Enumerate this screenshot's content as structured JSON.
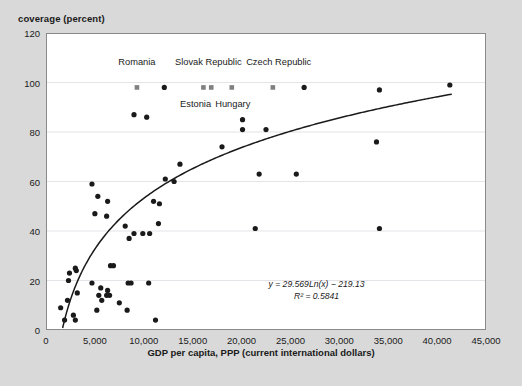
{
  "figure": {
    "bg_color": "#d9d9d9",
    "plot_bg_color": "#ffffff",
    "marker_color": "#1a1a1a",
    "highlight_marker_color": "#808080",
    "trend_color": "#1a1a1a",
    "grid_color": "#e3e3e8"
  },
  "chart_data": {
    "type": "scatter",
    "title": "",
    "ylabel": "coverage (percent)",
    "xlabel": "GDP per capita, PPP (current international dollars)",
    "xlim": [
      0,
      45000
    ],
    "ylim": [
      0,
      120
    ],
    "xticks": [
      0,
      5000,
      10000,
      15000,
      20000,
      25000,
      30000,
      35000,
      40000,
      45000
    ],
    "xtick_labels": [
      "0",
      "5,000",
      "10,000",
      "15,000",
      "20,000",
      "25,000",
      "30,000",
      "35,000",
      "40,000",
      "45,000"
    ],
    "yticks": [
      0,
      20,
      40,
      60,
      80,
      100,
      120
    ],
    "ytick_labels": [
      "0",
      "20",
      "40",
      "60",
      "80",
      "100",
      "120"
    ],
    "grid": "horizontal",
    "legend": "none",
    "annotations": [
      {
        "text": "y = 29.569Ln(x) − 219.13",
        "italic": true
      },
      {
        "text": "R² = 0.5841",
        "italic": true
      }
    ],
    "trendline": {
      "type": "logarithmic",
      "equation": "y = 29.569Ln(x) − 219.13",
      "r_squared": 0.5841,
      "slope": 29.569,
      "intercept": -219.13,
      "x_start": 1700,
      "x_end": 41500
    },
    "point_labels": [
      {
        "label": "Romania",
        "x": 9300,
        "y": 98,
        "label_x": 9300,
        "label_y": 108
      },
      {
        "label": "Slovak Republic",
        "x": 16600,
        "y": 98,
        "label_x": 16600,
        "label_y": 108
      },
      {
        "label": "Estonia",
        "x": 15900,
        "y": 98,
        "label_x": 15300,
        "label_y": 91
      },
      {
        "label": "Hungary",
        "x": 18800,
        "y": 98,
        "label_x": 19100,
        "label_y": 91
      },
      {
        "label": "Czech Republic",
        "x": 23200,
        "y": 98,
        "label_x": 23800,
        "label_y": 108
      }
    ],
    "series": [
      {
        "name": "highlighted-countries",
        "marker": "square",
        "color": "#808080",
        "points": [
          {
            "x": 9300,
            "y": 98,
            "name": "Romania"
          },
          {
            "x": 16100,
            "y": 98,
            "name": "Estonia"
          },
          {
            "x": 16900,
            "y": 98,
            "name": "Slovak Republic"
          },
          {
            "x": 19000,
            "y": 98,
            "name": "Hungary"
          },
          {
            "x": 23200,
            "y": 98,
            "name": "Czech Republic"
          }
        ]
      },
      {
        "name": "countries",
        "marker": "circle",
        "color": "#1a1a1a",
        "points": [
          {
            "x": 12100,
            "y": 98
          },
          {
            "x": 26400,
            "y": 98
          },
          {
            "x": 34100,
            "y": 97
          },
          {
            "x": 41300,
            "y": 99
          },
          {
            "x": 9000,
            "y": 87
          },
          {
            "x": 10300,
            "y": 86
          },
          {
            "x": 20100,
            "y": 85
          },
          {
            "x": 20100,
            "y": 81
          },
          {
            "x": 22500,
            "y": 81
          },
          {
            "x": 33800,
            "y": 76
          },
          {
            "x": 18000,
            "y": 74
          },
          {
            "x": 13700,
            "y": 67
          },
          {
            "x": 4700,
            "y": 59
          },
          {
            "x": 12200,
            "y": 61
          },
          {
            "x": 13100,
            "y": 60
          },
          {
            "x": 25600,
            "y": 63
          },
          {
            "x": 21800,
            "y": 63
          },
          {
            "x": 5300,
            "y": 54
          },
          {
            "x": 6300,
            "y": 52
          },
          {
            "x": 11000,
            "y": 52
          },
          {
            "x": 11600,
            "y": 51
          },
          {
            "x": 5000,
            "y": 47
          },
          {
            "x": 6200,
            "y": 46
          },
          {
            "x": 21400,
            "y": 41
          },
          {
            "x": 34100,
            "y": 41
          },
          {
            "x": 8100,
            "y": 42
          },
          {
            "x": 11500,
            "y": 43
          },
          {
            "x": 9000,
            "y": 39
          },
          {
            "x": 9900,
            "y": 39
          },
          {
            "x": 10600,
            "y": 39
          },
          {
            "x": 8500,
            "y": 37
          },
          {
            "x": 6600,
            "y": 26
          },
          {
            "x": 6900,
            "y": 26
          },
          {
            "x": 3000,
            "y": 25
          },
          {
            "x": 3100,
            "y": 24
          },
          {
            "x": 2400,
            "y": 23
          },
          {
            "x": 2300,
            "y": 20
          },
          {
            "x": 4700,
            "y": 19
          },
          {
            "x": 8400,
            "y": 19
          },
          {
            "x": 8700,
            "y": 19
          },
          {
            "x": 10500,
            "y": 19
          },
          {
            "x": 5600,
            "y": 17
          },
          {
            "x": 6300,
            "y": 16
          },
          {
            "x": 3200,
            "y": 15
          },
          {
            "x": 5400,
            "y": 14
          },
          {
            "x": 6200,
            "y": 14
          },
          {
            "x": 6500,
            "y": 14
          },
          {
            "x": 5700,
            "y": 12
          },
          {
            "x": 2200,
            "y": 12
          },
          {
            "x": 7500,
            "y": 11
          },
          {
            "x": 1500,
            "y": 9
          },
          {
            "x": 5200,
            "y": 8
          },
          {
            "x": 8300,
            "y": 8
          },
          {
            "x": 2800,
            "y": 6
          },
          {
            "x": 1900,
            "y": 4
          },
          {
            "x": 3000,
            "y": 4
          },
          {
            "x": 11200,
            "y": 4
          }
        ]
      }
    ]
  }
}
